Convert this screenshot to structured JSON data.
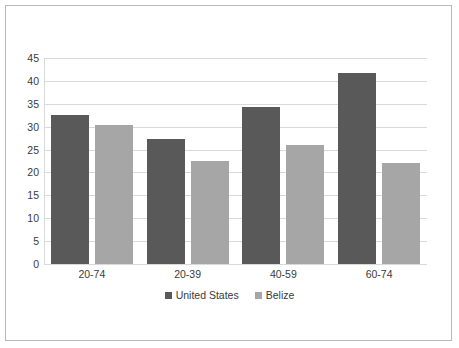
{
  "chart_data": {
    "type": "bar",
    "title": "",
    "subtitle": "",
    "xlabel": "",
    "ylabel": "",
    "categories": [
      "20-74",
      "20-39",
      "40-59",
      "60-74"
    ],
    "series": [
      {
        "name": "United States",
        "color": "#595959",
        "values": [
          32.5,
          27.4,
          34.3,
          41.8
        ]
      },
      {
        "name": "Belize",
        "color": "#a6a6a6",
        "values": [
          30.3,
          22.4,
          26.0,
          22.0
        ]
      }
    ],
    "ylim": [
      0,
      45
    ],
    "ytick_step": 5,
    "yticks": [
      45,
      40,
      35,
      30,
      25,
      20,
      15,
      10,
      5,
      0
    ],
    "ytick_labels": [
      "45",
      "40",
      "35",
      "30",
      "25",
      "20",
      "15",
      "10",
      "5",
      "0"
    ],
    "grid": "horizontal",
    "legend_position": "bottom-center",
    "legend_entries": [
      "United States",
      "Belize"
    ],
    "frame_border_color": "#b9b9b9",
    "gridline_color": "#d9d9d9",
    "background_color": "#ffffff"
  }
}
